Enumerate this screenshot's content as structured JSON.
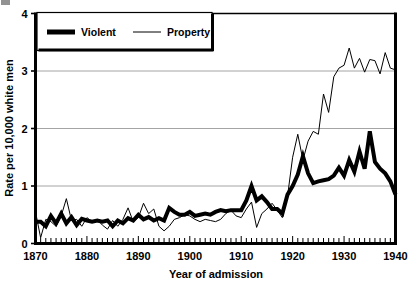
{
  "chart_data": {
    "type": "line",
    "title": "",
    "xlabel": "Year of admission",
    "ylabel": "Rate per 10,000 white men",
    "xlim": [
      1870,
      1940
    ],
    "ylim": [
      0,
      4
    ],
    "xticks": [
      1870,
      1880,
      1890,
      1900,
      1910,
      1920,
      1930,
      1940
    ],
    "yticks": [
      0,
      1,
      2,
      3,
      4
    ],
    "xtick_labels": [
      "1870",
      "1880",
      "1890",
      "1900",
      "1910",
      "1920",
      "1930",
      "1940"
    ],
    "ytick_labels": [
      "0",
      "1",
      "2",
      "3",
      "4"
    ],
    "minor_xtick_interval": 1,
    "grid": "horizontal",
    "legend_position": "top-left",
    "colors": {
      "violent": "#000000",
      "property": "#000000",
      "grid": "#9a9a9a",
      "axis": "#000000",
      "background": "#ffffff"
    },
    "series": [
      {
        "name": "Violent",
        "style": "thick",
        "linewidth": 4,
        "x": [
          1870,
          1871,
          1872,
          1873,
          1874,
          1875,
          1876,
          1877,
          1878,
          1879,
          1880,
          1881,
          1882,
          1883,
          1884,
          1885,
          1886,
          1887,
          1888,
          1889,
          1890,
          1891,
          1892,
          1893,
          1894,
          1895,
          1896,
          1897,
          1898,
          1899,
          1900,
          1901,
          1902,
          1903,
          1904,
          1905,
          1906,
          1907,
          1908,
          1909,
          1910,
          1911,
          1912,
          1913,
          1914,
          1915,
          1916,
          1917,
          1918,
          1919,
          1920,
          1921,
          1922,
          1923,
          1924,
          1925,
          1926,
          1927,
          1928,
          1929,
          1930,
          1931,
          1932,
          1933,
          1934,
          1935,
          1936,
          1937,
          1938,
          1939,
          1940
        ],
        "values": [
          0.38,
          0.38,
          0.3,
          0.48,
          0.35,
          0.52,
          0.35,
          0.46,
          0.32,
          0.43,
          0.4,
          0.38,
          0.4,
          0.38,
          0.4,
          0.3,
          0.4,
          0.35,
          0.44,
          0.4,
          0.5,
          0.42,
          0.46,
          0.4,
          0.44,
          0.4,
          0.62,
          0.55,
          0.5,
          0.5,
          0.55,
          0.48,
          0.5,
          0.52,
          0.5,
          0.55,
          0.58,
          0.56,
          0.58,
          0.58,
          0.58,
          0.75,
          1.0,
          0.75,
          0.82,
          0.72,
          0.6,
          0.6,
          0.52,
          0.85,
          1.0,
          1.2,
          1.52,
          1.22,
          1.05,
          1.08,
          1.1,
          1.12,
          1.18,
          1.32,
          1.18,
          1.45,
          1.25,
          1.6,
          1.3,
          1.95,
          1.42,
          1.3,
          1.22,
          1.08,
          0.85
        ]
      },
      {
        "name": "Property",
        "style": "thin",
        "linewidth": 1,
        "x": [
          1870,
          1871,
          1872,
          1873,
          1874,
          1875,
          1876,
          1877,
          1878,
          1879,
          1880,
          1881,
          1882,
          1883,
          1884,
          1885,
          1886,
          1887,
          1888,
          1889,
          1890,
          1891,
          1892,
          1893,
          1894,
          1895,
          1896,
          1897,
          1898,
          1899,
          1900,
          1901,
          1902,
          1903,
          1904,
          1905,
          1906,
          1907,
          1908,
          1909,
          1910,
          1911,
          1912,
          1913,
          1914,
          1915,
          1916,
          1917,
          1918,
          1919,
          1920,
          1921,
          1922,
          1923,
          1924,
          1925,
          1926,
          1927,
          1928,
          1929,
          1930,
          1931,
          1932,
          1933,
          1934,
          1935,
          1936,
          1937,
          1938,
          1939,
          1940
        ],
        "values": [
          0.55,
          0.1,
          0.42,
          0.38,
          0.3,
          0.48,
          0.78,
          0.4,
          0.42,
          0.3,
          0.45,
          0.38,
          0.42,
          0.32,
          0.25,
          0.4,
          0.3,
          0.42,
          0.62,
          0.38,
          0.45,
          0.7,
          0.52,
          0.6,
          0.3,
          0.22,
          0.3,
          0.42,
          0.45,
          0.5,
          0.48,
          0.42,
          0.38,
          0.42,
          0.4,
          0.38,
          0.42,
          0.52,
          0.58,
          0.48,
          0.45,
          0.6,
          0.72,
          0.28,
          0.52,
          0.6,
          0.7,
          0.58,
          0.45,
          0.82,
          1.5,
          1.9,
          1.45,
          1.78,
          1.95,
          1.9,
          2.6,
          2.28,
          2.9,
          3.05,
          3.1,
          3.4,
          3.05,
          3.22,
          2.98,
          3.2,
          3.18,
          2.95,
          3.32,
          3.05,
          3.02
        ]
      }
    ]
  },
  "legend": {
    "items": [
      {
        "label": "Violent",
        "style": "thick"
      },
      {
        "label": "Property",
        "style": "thin"
      }
    ]
  }
}
